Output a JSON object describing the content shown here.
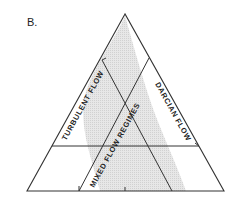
{
  "figure": {
    "panel_label": "B.",
    "type": "ternary-diagram",
    "regions": [
      {
        "label": "TURBULENT FLOW"
      },
      {
        "label": "MIXED FLOW REGIMES"
      },
      {
        "label": "DARCIAN FLOW"
      }
    ],
    "colors": {
      "line": "#333333",
      "shaded_band": "#dcdcdc",
      "background": "#ffffff"
    }
  }
}
